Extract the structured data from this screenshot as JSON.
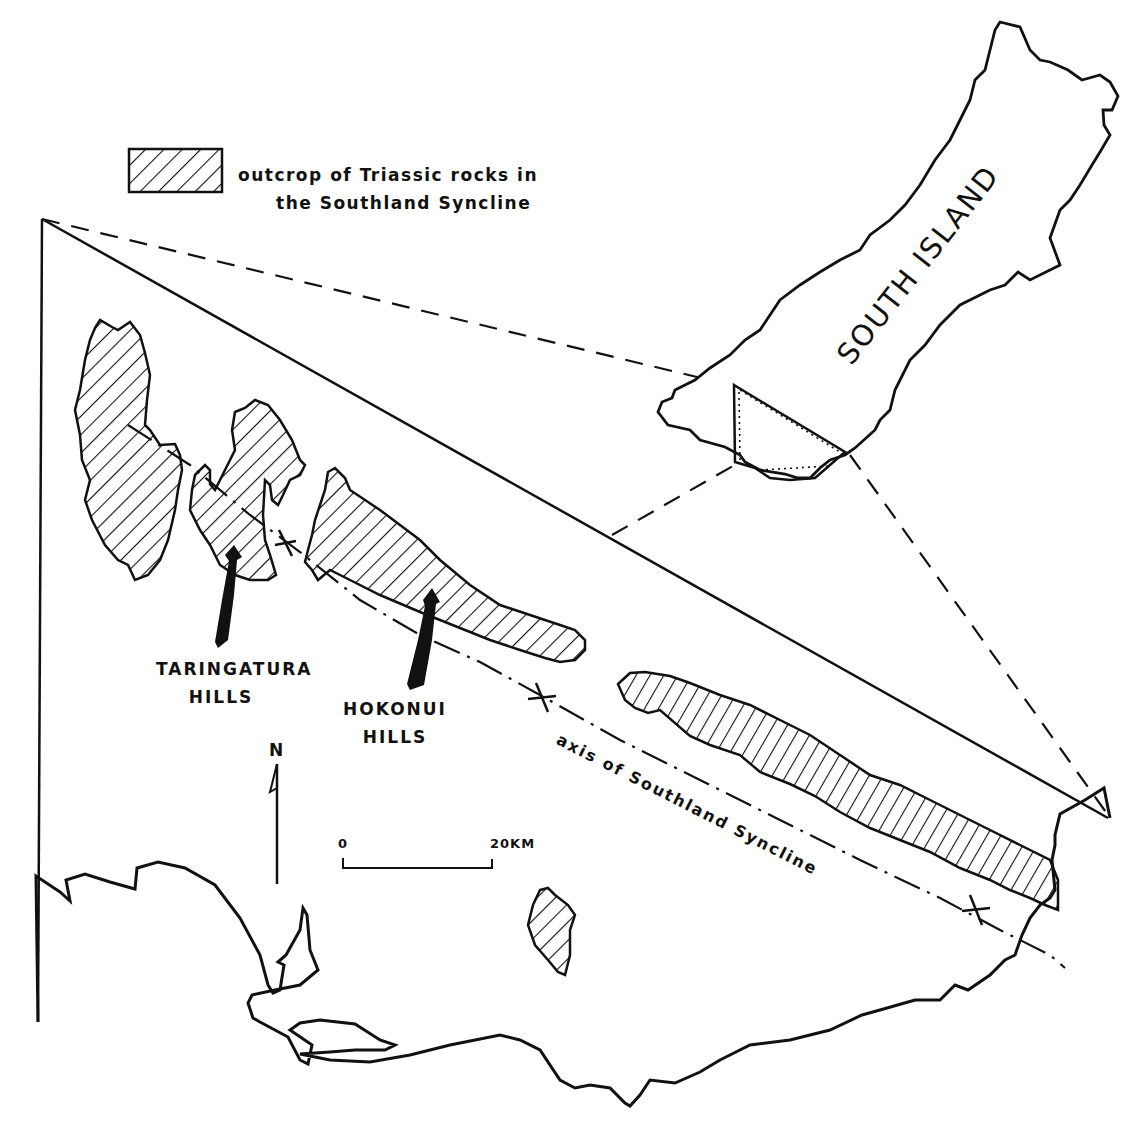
{
  "legend": {
    "swatch_pattern": "diagonal-hatch",
    "line1": "outcrop of Triassic rocks in",
    "line2": "the Southland Syncline"
  },
  "inset": {
    "label": "SOUTH ISLAND"
  },
  "places": {
    "taringatura": {
      "line1": "TARINGATURA",
      "line2": "HILLS"
    },
    "hokonui": {
      "line1": "HOKONUI",
      "line2": "HILLS"
    }
  },
  "axis": {
    "label": "axis of Southland Syncline"
  },
  "north_arrow": {
    "label": "N"
  },
  "scale_bar": {
    "start": "0",
    "end": "20KM"
  },
  "colors": {
    "ink": "#111111",
    "paper": "#ffffff"
  }
}
